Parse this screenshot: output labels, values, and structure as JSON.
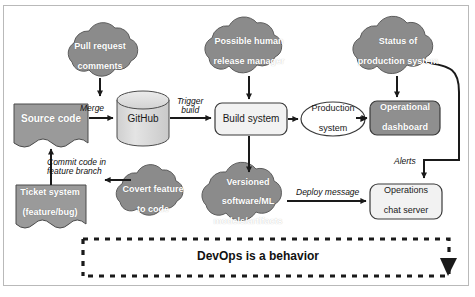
{
  "figure": {
    "banner_label": "DevOps is a behavior",
    "caption": ""
  },
  "palette": {
    "cloud_fill": "#8b8b8b",
    "cloud_stroke": "#5d5d5d",
    "dark_box_fill": "#8f8f8f",
    "light_box_fill": "#f2f2f2",
    "doc_fill": "#9a9a9a",
    "cylinder_fill": "#d8d8d8",
    "line": "#1a1a1a",
    "frame": "#b9b9b9",
    "text_light": "#ffffff",
    "text_dark": "#1a1a1a"
  },
  "nodes": [
    {
      "id": "pull-request-comments",
      "shape": "cloud",
      "style": "dark",
      "lines": [
        "Pull request",
        "comments"
      ]
    },
    {
      "id": "possible-human-release-manager",
      "shape": "cloud",
      "style": "dark",
      "lines": [
        "Possible human",
        "release manager"
      ]
    },
    {
      "id": "status-of-production-system",
      "shape": "cloud",
      "style": "dark",
      "lines": [
        "Status of",
        "production system"
      ]
    },
    {
      "id": "source-code",
      "shape": "document",
      "style": "dark",
      "lines": [
        "Source code"
      ]
    },
    {
      "id": "github",
      "shape": "cylinder",
      "style": "light",
      "lines": [
        "GitHub"
      ]
    },
    {
      "id": "build-system",
      "shape": "rounded-rect",
      "style": "light",
      "lines": [
        "Build system"
      ]
    },
    {
      "id": "production-system",
      "shape": "ellipse",
      "style": "light",
      "lines": [
        "Production",
        "system"
      ]
    },
    {
      "id": "operational-dashboard",
      "shape": "rounded-rect",
      "style": "dark",
      "lines": [
        "Operational",
        "dashboard"
      ]
    },
    {
      "id": "ticket-system",
      "shape": "document",
      "style": "dark",
      "lines": [
        "Ticket system",
        "(feature/bug)"
      ]
    },
    {
      "id": "covert-feature-to-code",
      "shape": "cloud",
      "style": "dark",
      "lines": [
        "Covert feature",
        "to code"
      ]
    },
    {
      "id": "versioned-software",
      "shape": "cloud",
      "style": "dark",
      "lines": [
        "Versioned",
        "software/ML",
        "models/artifacts"
      ]
    },
    {
      "id": "operations-chat-server",
      "shape": "rounded-rect",
      "style": "light",
      "lines": [
        "Operations",
        "chat server"
      ]
    }
  ],
  "edge_labels": [
    {
      "id": "merge",
      "lines": [
        "Merge"
      ]
    },
    {
      "id": "trigger-build",
      "lines": [
        "Trigger",
        "build"
      ]
    },
    {
      "id": "commit-code-in-feature-branch",
      "lines": [
        "Commit code in",
        "feature branch"
      ]
    },
    {
      "id": "deploy-message",
      "lines": [
        "Deploy message"
      ]
    },
    {
      "id": "alerts",
      "lines": [
        "Alerts"
      ]
    }
  ]
}
